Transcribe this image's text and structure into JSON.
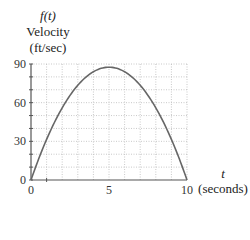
{
  "chart_data": {
    "type": "line",
    "title": "",
    "ylabel_lines": [
      "f(t)",
      "Velocity",
      "(ft/sec)"
    ],
    "xlabel_lines": [
      "t",
      "(seconds)"
    ],
    "xlim": [
      0,
      10
    ],
    "ylim": [
      0,
      90
    ],
    "x_ticks": [
      0,
      5,
      10
    ],
    "y_ticks": [
      0,
      30,
      60,
      90
    ],
    "grid": true,
    "grid_x_step": 1,
    "grid_y_step": 10,
    "series": [
      {
        "name": "f(t)",
        "x": [
          0,
          1,
          2,
          3,
          4,
          5,
          6,
          7,
          8,
          9,
          10
        ],
        "values": [
          0,
          31.5,
          56,
          73.5,
          84,
          87.5,
          84,
          73.5,
          56,
          31.5,
          0
        ]
      }
    ],
    "colors": {
      "curve": "#666666",
      "axis": "#555555",
      "grid": "#bbbbbb"
    }
  },
  "labels": {
    "y_fn": "f(t)",
    "y_title": "Velocity",
    "y_units": "(ft/sec)",
    "x_var": "t",
    "x_units": "(seconds)"
  }
}
